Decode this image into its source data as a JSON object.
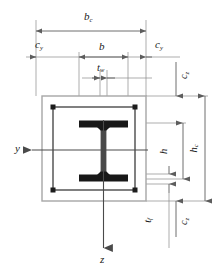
{
  "diagram": {
    "type": "composite-column-cross-section",
    "labels": {
      "b_c": {
        "base": "b",
        "sub": "c",
        "meaning": "overall concrete width"
      },
      "b": {
        "base": "b",
        "sub": "",
        "meaning": "steel flange width"
      },
      "t_w": {
        "base": "t",
        "sub": "w",
        "meaning": "web thickness"
      },
      "t_f": {
        "base": "t",
        "sub": "f",
        "meaning": "flange thickness"
      },
      "c_y_left": {
        "base": "c",
        "sub": "y",
        "meaning": "concrete cover in y direction, left"
      },
      "c_y_right": {
        "base": "c",
        "sub": "y",
        "meaning": "concrete cover in y direction, right"
      },
      "c_z_top": {
        "base": "c",
        "sub": "z",
        "meaning": "concrete cover in z direction, top"
      },
      "c_z_bottom": {
        "base": "c",
        "sub": "z",
        "meaning": "concrete cover in z direction, bottom"
      },
      "h": {
        "base": "h",
        "sub": "",
        "meaning": "steel section depth"
      },
      "h_c": {
        "base": "h",
        "sub": "c",
        "meaning": "overall concrete depth"
      },
      "axis_y": {
        "base": "y",
        "sub": "",
        "meaning": "horizontal axis pointing left"
      },
      "axis_z": {
        "base": "z",
        "sub": "",
        "meaning": "vertical axis pointing down"
      }
    },
    "colors": {
      "steel": "#1c1c1c",
      "rebar": "#1c1c1c",
      "stirrup": "#3a3a3a",
      "concrete_outline": "#9a9a9a",
      "dimension_line": "#6b6b6b",
      "background": "#ffffff"
    }
  }
}
